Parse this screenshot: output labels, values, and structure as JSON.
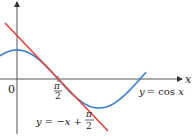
{
  "chart_data": {
    "type": "line",
    "title": "",
    "xlabel": "x",
    "ylabel": "",
    "origin_label": "0",
    "x_ticks": [
      {
        "value": 1.5708,
        "label_num": "π",
        "label_den": "2"
      }
    ],
    "xlim": [
      -0.6,
      4.3
    ],
    "ylim": [
      -1,
      2.7
    ],
    "grid": false,
    "legend": "inline annotations",
    "series": [
      {
        "name": "y = cos x",
        "color": "#3a7dc9",
        "function": "cos(x)",
        "x": [
          -0.6,
          0,
          0.785,
          1.571,
          2.356,
          3.142,
          3.927,
          4.712
        ],
        "y": [
          0.825,
          1,
          0.707,
          0,
          -0.707,
          -1,
          -0.707,
          0
        ]
      },
      {
        "name": "y = -x + π/2",
        "color": "#e0443a",
        "function": "-x + pi/2",
        "x": [
          -0.6,
          1.571,
          2.6
        ],
        "y": [
          2.171,
          0,
          -1.029
        ]
      }
    ],
    "annotations": [
      {
        "text": "y = cos x",
        "near": "right end of cosine curve"
      },
      {
        "text": "y = −x + π/2",
        "near": "bottom of tangent line"
      }
    ]
  },
  "labels": {
    "x_axis": "x",
    "origin": "0",
    "tick_num": "π",
    "tick_den": "2",
    "cos_label": "y = cos x",
    "line_label_main": "y = −x +",
    "line_label_num": "π",
    "line_label_den": "2"
  }
}
